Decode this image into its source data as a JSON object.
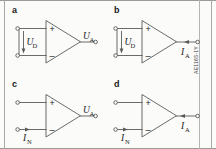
{
  "figure": {
    "code": "AE1165-1Y",
    "line_color": "#5a5a58",
    "text_color": "#1a1a1a",
    "background": "#fbfbfa"
  },
  "panels": [
    {
      "key": "a",
      "label": "a",
      "plus": "+",
      "minus": "–",
      "input_label": "U",
      "input_sub": "D",
      "output_label": "U",
      "output_sub": "A",
      "input_type": "voltage-source",
      "output_type": "voltage-terminal"
    },
    {
      "key": "b",
      "label": "b",
      "plus": "+",
      "minus": "–",
      "input_label": "U",
      "input_sub": "D",
      "output_label": "I",
      "output_sub": "A",
      "input_type": "voltage-source",
      "output_type": "current-terminal"
    },
    {
      "key": "c",
      "label": "c",
      "plus": "+",
      "minus": "–",
      "input_label": "I",
      "input_sub": "N",
      "output_label": "U",
      "output_sub": "A",
      "input_type": "current-source",
      "output_type": "voltage-terminal"
    },
    {
      "key": "d",
      "label": "d",
      "plus": "+",
      "minus": "–",
      "input_label": "I",
      "input_sub": "N",
      "output_label": "I",
      "output_sub": "A",
      "input_type": "current-source",
      "output_type": "current-terminal"
    }
  ]
}
